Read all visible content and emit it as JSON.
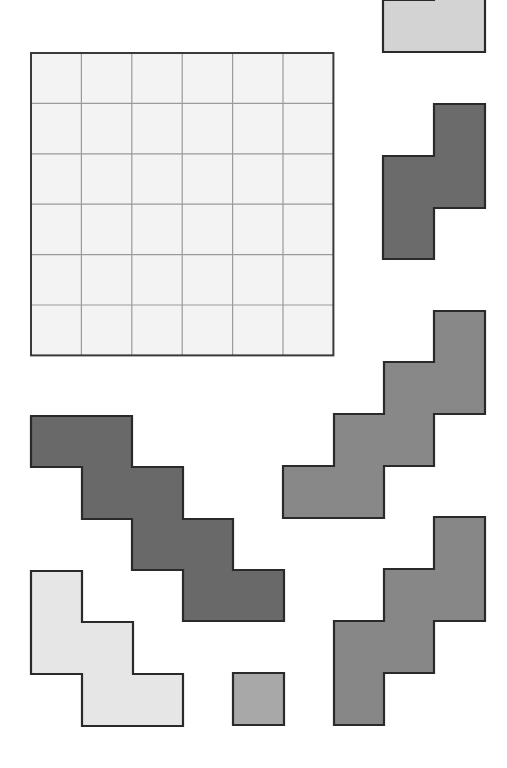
{
  "title": "",
  "board": {
    "x": 31,
    "y": 53,
    "rows": 6,
    "cols": 6,
    "cell": 50.4,
    "fill": "#f3f3f3",
    "line": "#9a9a9a",
    "border": "#3a3a3a"
  },
  "cell": 51.5,
  "pieces": [
    {
      "name": "piece-light-top",
      "fill": "#d3d3d3",
      "points": "383,0 434,0 434,-60 485,-60 485,52 383,52"
    },
    {
      "name": "piece-dark-s-tetromino",
      "fill": "#6b6b6b",
      "points": "434,104 485,104 485,208 434,208 434,259 383,259 383,156 434,156"
    },
    {
      "name": "piece-medium-staircase-7",
      "fill": "#888888",
      "points": "434,311 485,311 485,414 434,414 434,466 384,466 384,518 283,518 283,466 334,466 334,414 384,414 384,362 434,362"
    },
    {
      "name": "piece-dark-staircase-8",
      "fill": "#696969",
      "points": "31,416 132,416 132,467 183,467 183,519 233,519 233,570 284,570 284,621 183,621 183,570 132,570 132,519 82,519 82,467 31,467"
    },
    {
      "name": "piece-light-staircase-5",
      "fill": "#e6e6e6",
      "points": "31,571 82,571 82,622 133,622 133,674 183,674 183,726 82,726 82,674 31,674"
    },
    {
      "name": "piece-small-square",
      "fill": "#a8a8a8",
      "points": "233,673 284,673 284,725 233,725"
    },
    {
      "name": "piece-medium-staircase-6",
      "fill": "#878787",
      "points": "434,517 485,517 485,621 434,621 434,673 384,673 384,725 334,725 334,621 384,621 384,569 434,569"
    }
  ],
  "stroke": "#2a2a2a"
}
